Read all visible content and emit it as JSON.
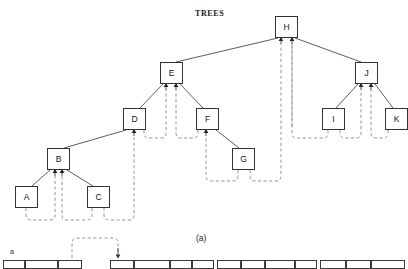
{
  "figure": {
    "title": "TREES",
    "caption": "(a)",
    "type": "threaded-binary-tree-diagram",
    "colors": {
      "solid_edge": "#333333",
      "dashed_thread": "#8a8a8a",
      "node_border": "#333333",
      "node_fill": "#ffffff",
      "text": "#151515",
      "background": "#ffffff"
    }
  },
  "tree": {
    "root": "H",
    "nodes": [
      {
        "id": "H",
        "label": "H",
        "x": 275,
        "y": 16,
        "w": 23,
        "h": 22
      },
      {
        "id": "E",
        "label": "E",
        "x": 160,
        "y": 62,
        "w": 23,
        "h": 22
      },
      {
        "id": "J",
        "label": "J",
        "x": 355,
        "y": 62,
        "w": 23,
        "h": 22
      },
      {
        "id": "D",
        "label": "D",
        "x": 123,
        "y": 108,
        "w": 23,
        "h": 22
      },
      {
        "id": "F",
        "label": "F",
        "x": 196,
        "y": 108,
        "w": 23,
        "h": 22
      },
      {
        "id": "I",
        "label": "I",
        "x": 322,
        "y": 108,
        "w": 23,
        "h": 22
      },
      {
        "id": "K",
        "label": "K",
        "x": 385,
        "y": 108,
        "w": 23,
        "h": 22
      },
      {
        "id": "B",
        "label": "B",
        "x": 47,
        "y": 148,
        "w": 23,
        "h": 22
      },
      {
        "id": "G",
        "label": "G",
        "x": 232,
        "y": 148,
        "w": 23,
        "h": 22
      },
      {
        "id": "A",
        "label": "A",
        "x": 15,
        "y": 186,
        "w": 23,
        "h": 22
      },
      {
        "id": "C",
        "label": "C",
        "x": 87,
        "y": 186,
        "w": 23,
        "h": 22
      }
    ],
    "edges": [
      {
        "from": "H",
        "to": "E",
        "style": "solid"
      },
      {
        "from": "H",
        "to": "J",
        "style": "solid"
      },
      {
        "from": "E",
        "to": "D",
        "style": "solid"
      },
      {
        "from": "E",
        "to": "F",
        "style": "solid"
      },
      {
        "from": "D",
        "to": "B",
        "style": "solid"
      },
      {
        "from": "B",
        "to": "A",
        "style": "solid"
      },
      {
        "from": "B",
        "to": "C",
        "style": "solid"
      },
      {
        "from": "F",
        "to": "G",
        "style": "solid"
      },
      {
        "from": "J",
        "to": "I",
        "style": "solid"
      },
      {
        "from": "J",
        "to": "K",
        "style": "solid"
      }
    ],
    "threads": [
      {
        "from": "A",
        "to": "B",
        "style": "dashed"
      },
      {
        "from": "C",
        "to": "B",
        "style": "dashed"
      },
      {
        "from": "C",
        "to": "D",
        "style": "dashed"
      },
      {
        "from": "D",
        "to": "E",
        "style": "dashed"
      },
      {
        "from": "F",
        "to": "E",
        "style": "dashed"
      },
      {
        "from": "G",
        "to": "F",
        "style": "dashed"
      },
      {
        "from": "G",
        "to": "H",
        "style": "dashed"
      },
      {
        "from": "I",
        "to": "J",
        "style": "dashed"
      },
      {
        "from": "K",
        "to": "J",
        "style": "dashed"
      },
      {
        "from": "E",
        "to": "H",
        "style": "dashed"
      }
    ]
  },
  "array": {
    "row_label": "a",
    "thread_arrow": true,
    "groups": [
      {
        "cells": [
          {
            "x": 3,
            "w": 22
          },
          {
            "x": 25,
            "w": 33
          },
          {
            "x": 58,
            "w": 24
          }
        ]
      },
      {
        "cells": [
          {
            "x": 110,
            "w": 24
          },
          {
            "x": 134,
            "w": 36
          },
          {
            "x": 170,
            "w": 22
          },
          {
            "x": 192,
            "w": 22
          }
        ]
      },
      {
        "cells": [
          {
            "x": 217,
            "w": 24
          },
          {
            "x": 241,
            "w": 24
          },
          {
            "x": 265,
            "w": 30
          },
          {
            "x": 295,
            "w": 22
          }
        ]
      },
      {
        "cells": [
          {
            "x": 320,
            "w": 26
          },
          {
            "x": 346,
            "w": 25
          },
          {
            "x": 371,
            "w": 34
          }
        ]
      }
    ]
  }
}
